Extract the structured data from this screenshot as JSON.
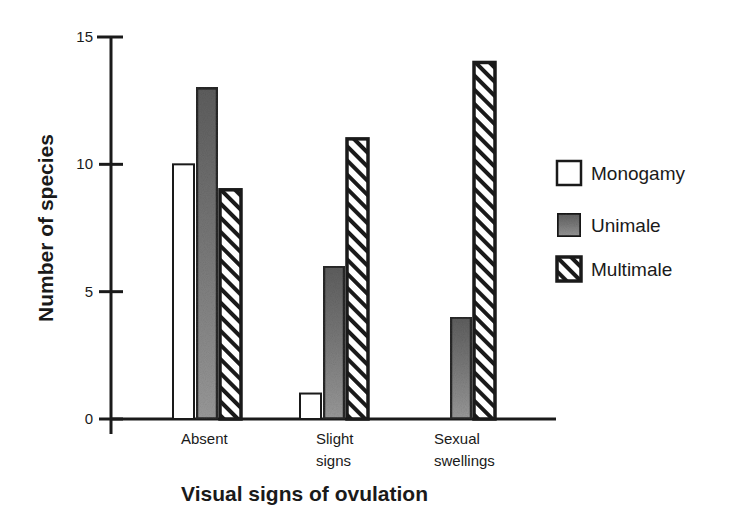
{
  "chart_data": {
    "type": "bar",
    "title": "",
    "xlabel": "Visual signs of ovulation",
    "ylabel": "Number of species",
    "ylim": [
      0,
      15
    ],
    "yticks": [
      0,
      5,
      10,
      15
    ],
    "categories": [
      "Absent",
      "Slight signs",
      "Sexual swellings"
    ],
    "category_label_lines": [
      [
        "Absent"
      ],
      [
        "Slight",
        "signs"
      ],
      [
        "Sexual",
        "swellings"
      ]
    ],
    "series": [
      {
        "name": "Monogamy",
        "fill": "white",
        "values": [
          10,
          1,
          0
        ]
      },
      {
        "name": "Unimale",
        "fill": "gray-stipple",
        "values": [
          13,
          6,
          4
        ]
      },
      {
        "name": "Multimale",
        "fill": "diagonal-hatch",
        "values": [
          9,
          11,
          14
        ]
      }
    ],
    "legend_position": "right",
    "grid": false
  },
  "colors": {
    "axis": "#1a1a1a",
    "unimale_fill": "#8a8a8a",
    "unimale_border": "#2a2a2a",
    "background": "#ffffff"
  }
}
